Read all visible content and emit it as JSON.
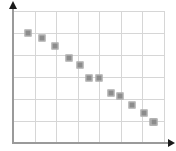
{
  "chart_data": {
    "type": "scatter",
    "title": "",
    "subtitle": "",
    "xlabel": "",
    "ylabel": "",
    "xlim": [
      0,
      7
    ],
    "ylim": [
      0,
      6
    ],
    "grid": true,
    "legend": null,
    "legend_position": "none",
    "x_ticks": [
      0,
      1,
      2,
      3,
      4,
      5,
      6,
      7
    ],
    "y_ticks": [
      0,
      1,
      2,
      3,
      4,
      5,
      6
    ],
    "x_tick_labels": [],
    "y_tick_labels": [],
    "annotations": [],
    "marker_style": "square",
    "marker_color": "#8c8c8c",
    "marker_edge_color": "#bdbdbd",
    "grid_color": "#d6d6d6",
    "axis_color": "#9a9a9a",
    "arrow_color": "#1a1a1a",
    "background": "#ffffff",
    "series": [
      {
        "name": "series-1",
        "points": [
          {
            "x": 0.68,
            "y": 5.0
          },
          {
            "x": 1.36,
            "y": 4.77
          },
          {
            "x": 1.95,
            "y": 4.41
          },
          {
            "x": 2.59,
            "y": 3.86
          },
          {
            "x": 3.09,
            "y": 3.55
          },
          {
            "x": 3.5,
            "y": 2.95
          },
          {
            "x": 4.0,
            "y": 2.95
          },
          {
            "x": 4.55,
            "y": 2.27
          },
          {
            "x": 4.95,
            "y": 2.14
          },
          {
            "x": 5.5,
            "y": 1.73
          },
          {
            "x": 6.05,
            "y": 1.36
          },
          {
            "x": 6.5,
            "y": 0.95
          },
          {
            "x": 6.55,
            "y": 0.95
          }
        ]
      }
    ]
  },
  "axes": {
    "y_axis_name": "y-axis",
    "x_axis_name": "x-axis",
    "y_arrow_name": "y-axis-arrow",
    "x_arrow_name": "x-axis-arrow"
  }
}
